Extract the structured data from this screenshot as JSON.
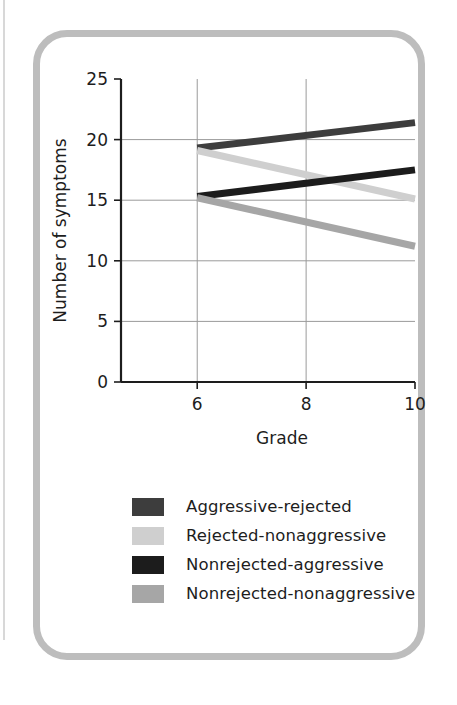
{
  "figure": {
    "border_color": "#bdbdbd",
    "background": "#ffffff"
  },
  "chart_data": {
    "type": "line",
    "title": "",
    "subtitle": "",
    "xlabel": "Grade",
    "ylabel": "Number of symptoms",
    "x": [
      6,
      10
    ],
    "xlim": [
      4.6,
      10
    ],
    "ylim": [
      0,
      25
    ],
    "xticks": [
      6,
      8,
      10
    ],
    "xtick_labels": [
      "6",
      "8",
      "10"
    ],
    "yticks": [
      0,
      5,
      10,
      15,
      20,
      25
    ],
    "ytick_labels": [
      "0",
      "5",
      "10",
      "15",
      "20",
      "25"
    ],
    "grid": "horizontal-and-vertical",
    "legend_position": "below-plot",
    "series": [
      {
        "name": "Aggressive-rejected",
        "color": "#3d3d3d",
        "values": [
          19.3,
          21.4
        ]
      },
      {
        "name": "Rejected-nonaggressive",
        "color": "#cfcfcf",
        "values": [
          19.1,
          15.1
        ]
      },
      {
        "name": "Nonrejected-aggressive",
        "color": "#1c1c1c",
        "values": [
          15.3,
          17.5
        ]
      },
      {
        "name": "Nonrejected-nonaggressive",
        "color": "#a6a6a6",
        "values": [
          15.2,
          11.2
        ]
      }
    ]
  },
  "legend": {
    "items": [
      {
        "label": "Aggressive-rejected",
        "color": "#3d3d3d"
      },
      {
        "label": "Rejected-nonaggressive",
        "color": "#cfcfcf"
      },
      {
        "label": "Nonrejected-aggressive",
        "color": "#1c1c1c"
      },
      {
        "label": "Nonrejected-nonaggressive",
        "color": "#a6a6a6"
      }
    ]
  }
}
